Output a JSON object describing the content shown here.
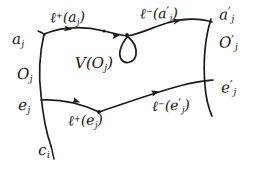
{
  "figure": {
    "kind": "hand-drawn-diagram",
    "background_color": "#ffffff",
    "ink_color": "#1c1a1a",
    "region_label": "V(O_j)"
  },
  "labels": {
    "left_top": {
      "base": "a",
      "sub": "j"
    },
    "left_mid": {
      "base": "O",
      "sub": "j"
    },
    "left_low": {
      "base": "e",
      "sub": "j"
    },
    "left_bottom": {
      "base": "c",
      "sub": "i"
    },
    "right_top": {
      "base": "a",
      "prime": "′",
      "sub": "j"
    },
    "right_mid": {
      "base": "O",
      "prime": "′",
      "sub": "j"
    },
    "right_low": {
      "base": "e",
      "prime": "′",
      "sub": "j"
    },
    "center": {
      "v": "V",
      "open": "(",
      "base": "O",
      "sub": "j",
      "close": ")"
    },
    "top_left_arc": {
      "l": "ℓ",
      "sup": "+",
      "open": "(",
      "base": "a",
      "sub": "j",
      "close": ")"
    },
    "top_right_arc": {
      "l": "ℓ",
      "sup": "−",
      "open": "(",
      "base": "a",
      "prime": "′",
      "sub": "j",
      "close": ")"
    },
    "bottom_left_arc": {
      "l": "ℓ",
      "sup": "+",
      "open": "(",
      "base": "e",
      "sub": "j",
      "close": ")"
    },
    "bottom_right_arc": {
      "l": "ℓ",
      "sup": "−",
      "open": "(",
      "base": "e",
      "prime": "′",
      "sub": "j",
      "close": ")"
    }
  },
  "strokes": {
    "left_boundary": "M 44 34 C 40 52, 38 72, 41 95 C 43 116, 46 132, 51 146",
    "right_boundary": "M 209 24 C 204 44, 203 66, 205 88 C 206 99, 208 107, 211 114",
    "top_arc_left": "M 44 34 C 60 28, 82 27, 104 31 C 112 33, 120 35, 127 35",
    "top_arc_right": "M 127 35 C 140 34, 152 28, 166 24 C 182 20, 197 20, 209 24",
    "bottom_arc_left": "M 41 100 C 60 99, 80 103, 99 112",
    "bottom_arc_right": "M 99 112 C 125 103, 155 92, 182 85 C 193 82, 202 81, 211 80",
    "left_tail": "M 51 146 C 52 150, 53 154, 54 158",
    "loop": "M 127 36 C 122 44, 119 52, 122 58 C 126 64, 134 62, 135 54 C 136 46, 131 40, 127 36"
  },
  "arrows": [
    {
      "name": "top-arrow-1",
      "x": 70,
      "y": 30,
      "angle": 8
    },
    {
      "name": "top-arrow-2",
      "x": 117,
      "y": 34,
      "angle": -2
    },
    {
      "name": "top-arrow-3",
      "x": 178,
      "y": 21,
      "angle": -6
    },
    {
      "name": "bottom-arrow-1",
      "x": 77,
      "y": 102,
      "angle": 18
    },
    {
      "name": "bottom-arrow-2",
      "x": 156,
      "y": 92,
      "angle": -16
    }
  ],
  "vertices": [
    {
      "name": "top-loop-vertex",
      "x": 127,
      "y": 35
    },
    {
      "name": "top-mid-vertex",
      "x": 104,
      "y": 31
    },
    {
      "name": "bottom-cusp-vertex",
      "x": 99,
      "y": 112
    },
    {
      "name": "left-lower-vertex",
      "x": 41,
      "y": 100
    }
  ]
}
